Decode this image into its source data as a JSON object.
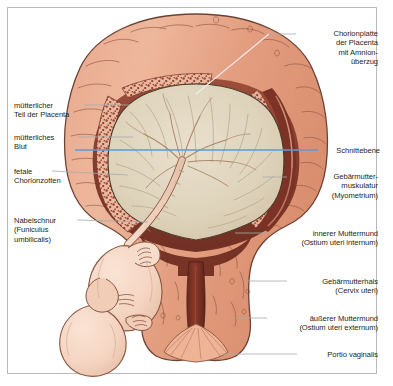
{
  "figure": {
    "kind": "anatomical-illustration",
    "language": "de",
    "border_color": "#b9b9b9",
    "background_color": "#ffffff",
    "text_color": "#231f20"
  },
  "palette": {
    "myometrium_outer": "#e8a488",
    "myometrium_mid": "#dd9272",
    "myometrium_shadow": "#c9795c",
    "myometrium_light": "#f0bda6",
    "decidua_dark": "#7c3326",
    "decidua_mid": "#9e4a35",
    "villi_stipple": "#a8442f",
    "amniotic_cavity": "#ded2bb",
    "amniotic_light": "#e8dfcc",
    "chorion_plate": "#e0cdb2",
    "fetus_skin": "#f6d9c8",
    "fetus_shadow": "#e9bfa8",
    "cord": "#efd2bd",
    "cervical_canal": "#6e2c20",
    "outline": "#3a2a22",
    "section_plane_blue": "#5b9bd5",
    "leader_line": "#a9a9a9",
    "leader_line_light": "#d6d6d6"
  },
  "section_plane": {
    "label": "Schnittebene",
    "color": "#5b9bd5",
    "y": 150,
    "x_start": 75,
    "x_end": 318
  },
  "labels_left": [
    {
      "id": "maternal-placenta",
      "text": "mütterlicher\nTeil der Placenta",
      "x": 14,
      "y": 101,
      "leader": {
        "x1": 84,
        "y1": 105,
        "x2": 130,
        "y2": 105
      }
    },
    {
      "id": "maternal-blood",
      "text": "mütterliches\nBlut",
      "x": 14,
      "y": 133,
      "leader": {
        "x1": 78,
        "y1": 137,
        "x2": 133,
        "y2": 137
      }
    },
    {
      "id": "fetal-chorionic-villi",
      "text": "fetale\nChorionzotten",
      "x": 14,
      "y": 167,
      "leader": {
        "x1": 52,
        "y1": 171,
        "x2": 128,
        "y2": 175
      }
    },
    {
      "id": "umbilical-cord",
      "text": "Nabelschnur\n(Funiculus\numbilicalis)",
      "x": 14,
      "y": 216,
      "leader": {
        "x1": 77,
        "y1": 220,
        "x2": 148,
        "y2": 222
      }
    }
  ],
  "labels_right": [
    {
      "id": "chorionic-plate",
      "text": "Chorionplatte\nder Placenta\nmit Amnion-\nüberzug",
      "x": 300,
      "y": 29,
      "width": 78,
      "leader": {
        "x1": 269,
        "y1": 34,
        "x2": 296,
        "y2": 34
      }
    },
    {
      "id": "section-plane",
      "text": "Schnittebene",
      "x": 318,
      "y": 146,
      "width": 60,
      "leader": {
        "x1": 300,
        "y1": 150,
        "x2": 316,
        "y2": 150
      }
    },
    {
      "id": "myometrium",
      "text": "Gebärmutter-\nmuskulatur\n(Myometrium)",
      "x": 290,
      "y": 172,
      "width": 88,
      "leader": {
        "x1": 263,
        "y1": 177,
        "x2": 287,
        "y2": 177
      }
    },
    {
      "id": "internal-os",
      "text": "innerer Muttermund\n(Ostium uteri internum)",
      "x": 270,
      "y": 229,
      "width": 108,
      "leader": {
        "x1": 235,
        "y1": 233,
        "x2": 267,
        "y2": 233
      }
    },
    {
      "id": "cervix-uteri",
      "text": "Gebärmutterhals\n(Cervix uteri)",
      "x": 290,
      "y": 277,
      "width": 88,
      "leader": {
        "x1": 247,
        "y1": 281,
        "x2": 287,
        "y2": 281
      }
    },
    {
      "id": "external-os",
      "text": "äußerer Muttermund\n(Ostium uteri externum)",
      "x": 270,
      "y": 314,
      "width": 108,
      "leader": {
        "x1": 236,
        "y1": 318,
        "x2": 267,
        "y2": 318
      }
    },
    {
      "id": "portio-vaginalis",
      "text": "Portio vaginalis",
      "x": 300,
      "y": 350,
      "width": 78,
      "leader": {
        "x1": 220,
        "y1": 354,
        "x2": 297,
        "y2": 354
      }
    }
  ],
  "internal_leaders": [
    {
      "id": "chorionic-plate-pointer",
      "x1": 269,
      "y1": 34,
      "x2": 196,
      "y2": 94
    }
  ]
}
